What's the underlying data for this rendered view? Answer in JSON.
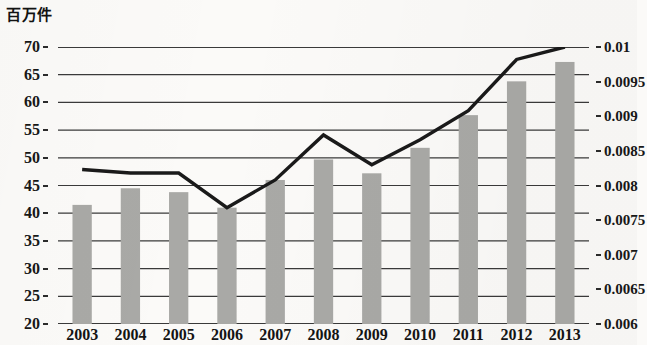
{
  "unit_label": "百万件",
  "colors": {
    "bar": "#a9a9a6",
    "bar_edge": "#9a9a97",
    "line": "#1a1a1a",
    "grid": "#3a3a3a",
    "text": "#161616",
    "background": "#fbfaf8"
  },
  "axes": {
    "left_ticks": [
      "20",
      "25",
      "30",
      "35",
      "40",
      "45",
      "50",
      "55",
      "60",
      "65",
      "70"
    ],
    "right_ticks": [
      "0.006",
      "0.0065",
      "0.007",
      "0.0075",
      "0.008",
      "0.0085",
      "0.009",
      "0.0095",
      "0.01"
    ],
    "x_ticks": [
      "2003",
      "2004",
      "2005",
      "2006",
      "2007",
      "2008",
      "2009",
      "2010",
      "2011",
      "2012",
      "2013"
    ]
  },
  "chart_data": {
    "type": "bar",
    "title": "",
    "subtitle": "",
    "xlabel": "",
    "ylabel": "百万件",
    "y2label": "",
    "categories": [
      "2003",
      "2004",
      "2005",
      "2006",
      "2007",
      "2008",
      "2009",
      "2010",
      "2011",
      "2012",
      "2013"
    ],
    "ylim": [
      20,
      70
    ],
    "y2lim": [
      0.006,
      0.01
    ],
    "grid": true,
    "legend": "none",
    "series": [
      {
        "name": "bars",
        "type": "bar",
        "axis": "left",
        "color": "#a9a9a6",
        "values": [
          41.5,
          44.5,
          43.8,
          41.0,
          46.0,
          49.7,
          47.2,
          51.8,
          57.7,
          63.8,
          67.3
        ]
      },
      {
        "name": "line",
        "type": "line",
        "axis": "right",
        "color": "#1a1a1a",
        "values": [
          0.00823,
          0.00818,
          0.00818,
          0.00768,
          0.00808,
          0.00873,
          0.0083,
          0.00866,
          0.00908,
          0.00982,
          0.01
        ]
      }
    ]
  }
}
